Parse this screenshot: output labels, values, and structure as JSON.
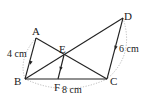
{
  "diagram": {
    "points": {
      "A": {
        "label": "A",
        "x": 36,
        "y": 38
      },
      "B": {
        "label": "B",
        "x": 25,
        "y": 79
      },
      "C": {
        "label": "C",
        "x": 107,
        "y": 79
      },
      "D": {
        "label": "D",
        "x": 123,
        "y": 18
      },
      "E": {
        "label": "E",
        "x": 64,
        "y": 55
      },
      "F": {
        "label": "F",
        "x": 58,
        "y": 79
      }
    },
    "measurements": {
      "AB": "4 cm",
      "DC": "6 cm",
      "BC": "8 cm"
    },
    "colors": {
      "line": "#222222",
      "dotted": "#aaaaaa"
    }
  }
}
